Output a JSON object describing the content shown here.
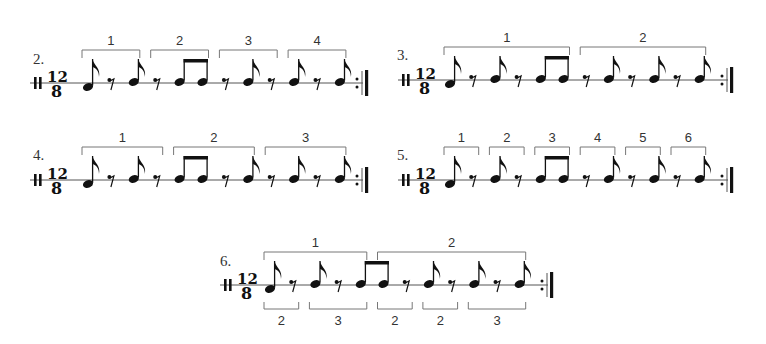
{
  "time_signature": {
    "top": "12",
    "bottom": "8"
  },
  "exercises": [
    {
      "label": "2.",
      "events": [
        "n",
        "r",
        "n",
        "r",
        "b",
        "b",
        "r",
        "n",
        "r",
        "n",
        "r",
        "n"
      ],
      "groups_above": [
        {
          "label": "1",
          "from": 0,
          "to": 2
        },
        {
          "label": "2",
          "from": 3,
          "to": 5
        },
        {
          "label": "3",
          "from": 6,
          "to": 8
        },
        {
          "label": "4",
          "from": 9,
          "to": 11
        }
      ],
      "groups_below": []
    },
    {
      "label": "3.",
      "events": [
        "n",
        "r",
        "n",
        "r",
        "b",
        "b",
        "r",
        "n",
        "r",
        "n",
        "r",
        "n"
      ],
      "groups_above": [
        {
          "label": "1",
          "from": 0,
          "to": 5
        },
        {
          "label": "2",
          "from": 6,
          "to": 11
        }
      ],
      "groups_below": []
    },
    {
      "label": "4.",
      "events": [
        "n",
        "r",
        "n",
        "r",
        "b",
        "b",
        "r",
        "n",
        "r",
        "n",
        "r",
        "n"
      ],
      "groups_above": [
        {
          "label": "1",
          "from": 0,
          "to": 3
        },
        {
          "label": "2",
          "from": 4,
          "to": 7
        },
        {
          "label": "3",
          "from": 8,
          "to": 11
        }
      ],
      "groups_below": []
    },
    {
      "label": "5.",
      "events": [
        "n",
        "r",
        "n",
        "r",
        "b",
        "b",
        "r",
        "n",
        "r",
        "n",
        "r",
        "n"
      ],
      "groups_above": [
        {
          "label": "1",
          "from": 0,
          "to": 1
        },
        {
          "label": "2",
          "from": 2,
          "to": 3
        },
        {
          "label": "3",
          "from": 4,
          "to": 5
        },
        {
          "label": "4",
          "from": 6,
          "to": 7
        },
        {
          "label": "5",
          "from": 8,
          "to": 9
        },
        {
          "label": "6",
          "from": 10,
          "to": 11
        }
      ],
      "groups_below": []
    },
    {
      "label": "6.",
      "events": [
        "n",
        "r",
        "n",
        "r",
        "b",
        "b",
        "r",
        "n",
        "r",
        "n",
        "r",
        "n"
      ],
      "groups_above": [
        {
          "label": "1",
          "from": 0,
          "to": 4
        },
        {
          "label": "2",
          "from": 5,
          "to": 11
        }
      ],
      "groups_below": [
        {
          "label": "2",
          "from": 0,
          "to": 1
        },
        {
          "label": "3",
          "from": 2,
          "to": 4
        },
        {
          "label": "2",
          "from": 5,
          "to": 6
        },
        {
          "label": "2",
          "from": 7,
          "to": 8
        },
        {
          "label": "3",
          "from": 9,
          "to": 11
        }
      ]
    }
  ]
}
